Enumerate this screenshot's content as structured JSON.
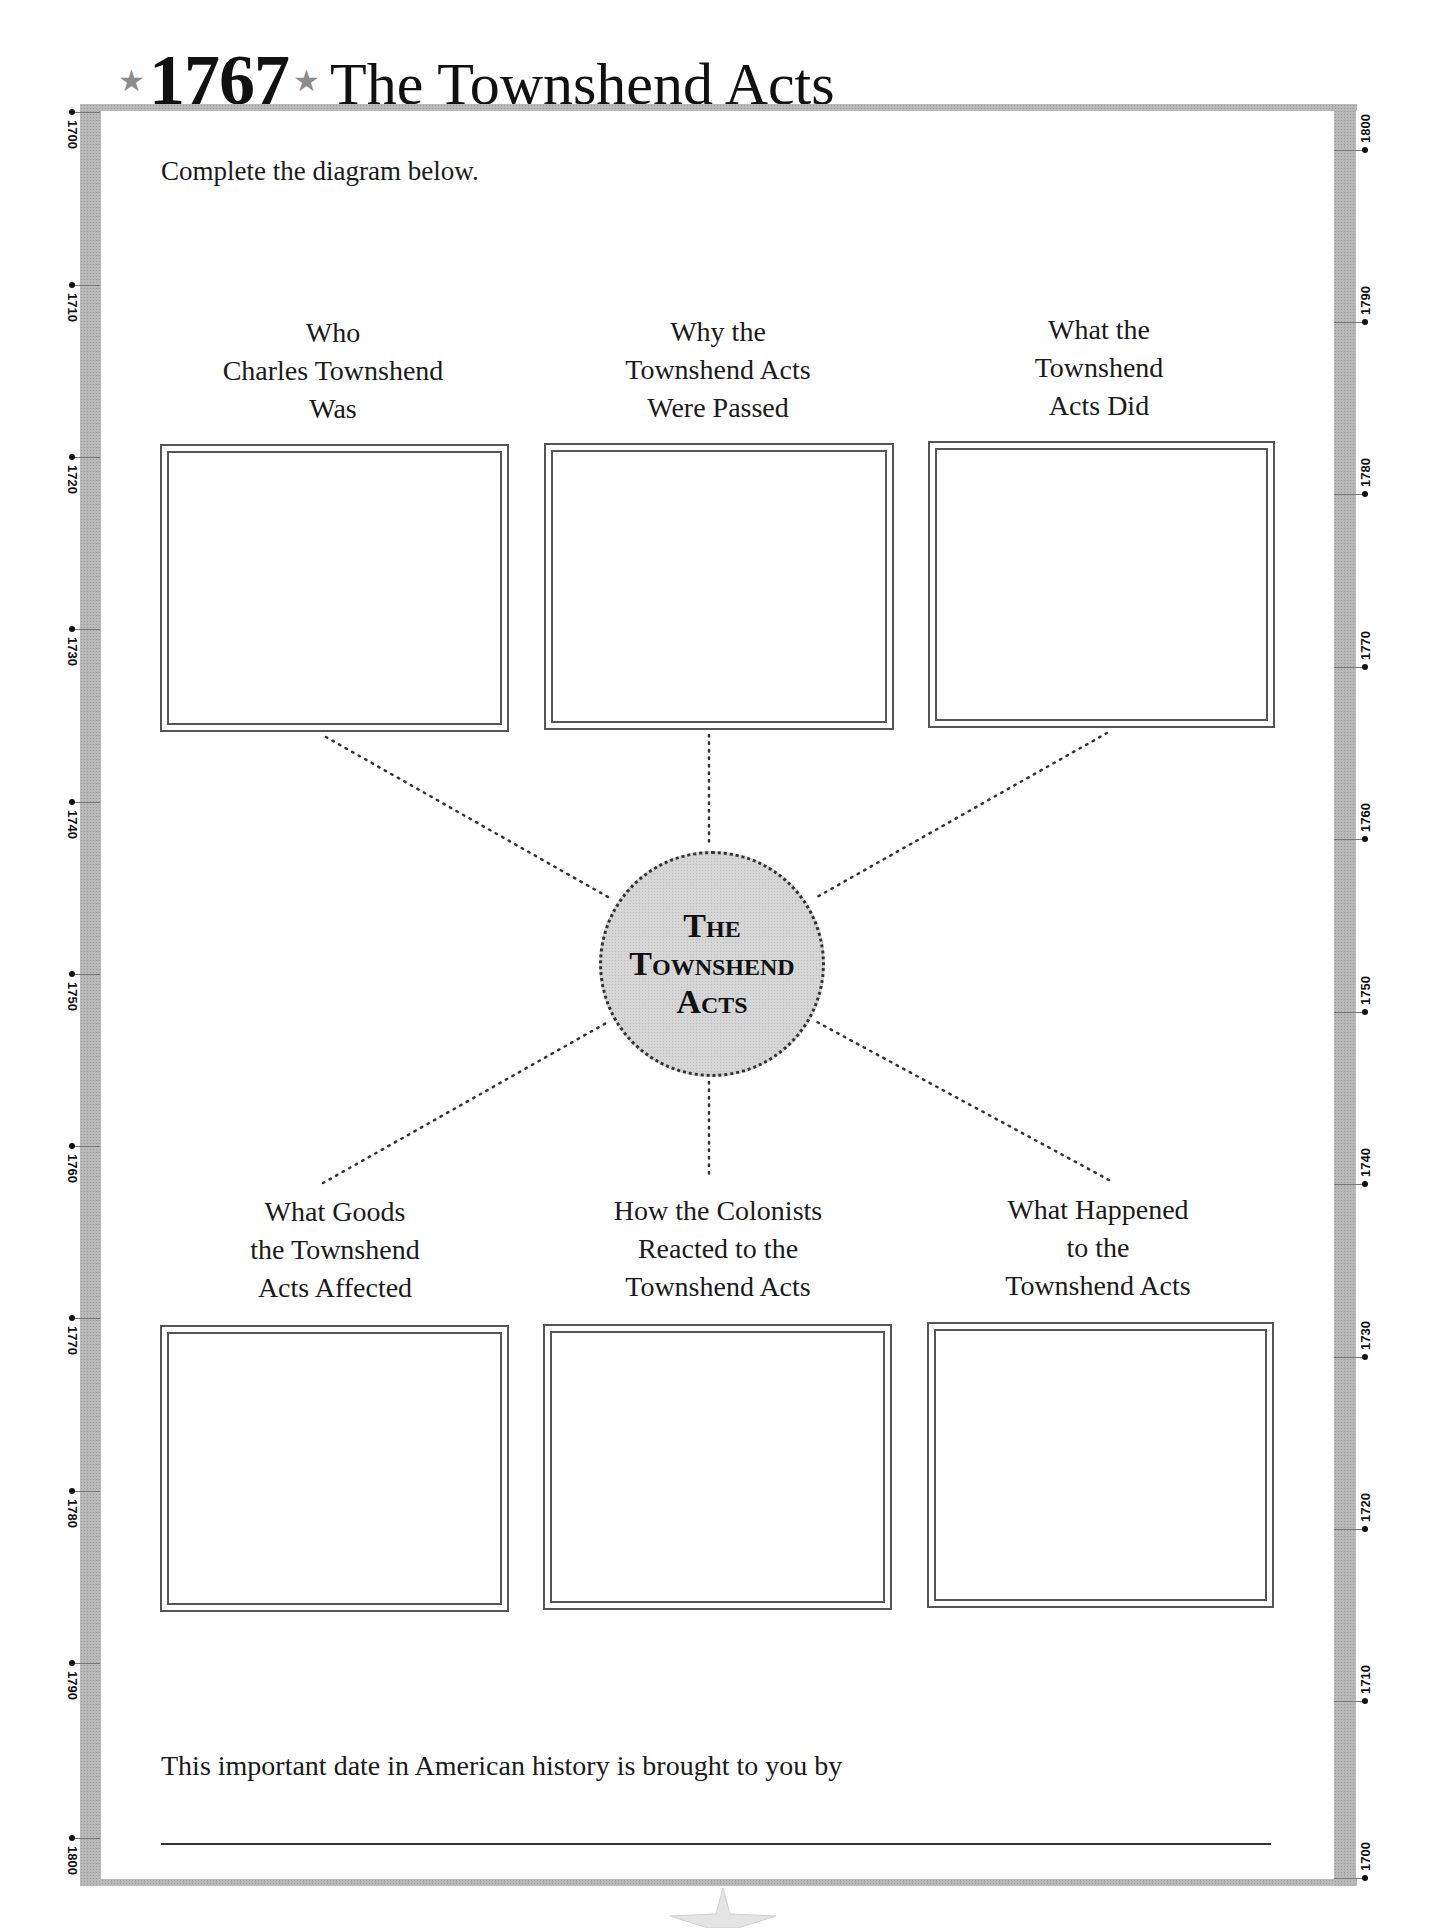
{
  "header": {
    "year": "1767",
    "title": "The Townshend Acts",
    "star_icon": "★"
  },
  "instructions": "Complete the diagram below.",
  "timeline": {
    "left_labels": [
      "1700",
      "1710",
      "1720",
      "1730",
      "1740",
      "1750",
      "1760",
      "1770",
      "1780",
      "1790",
      "1800"
    ],
    "right_labels": [
      "1800",
      "1790",
      "1780",
      "1770",
      "1760",
      "1750",
      "1740",
      "1730",
      "1720",
      "1710",
      "1700"
    ]
  },
  "diagram": {
    "center": {
      "line1": "The",
      "line2": "Townshend",
      "line3": "Acts"
    },
    "boxes": [
      {
        "label": [
          "Who",
          "Charles Townshend",
          "Was"
        ],
        "answer": ""
      },
      {
        "label": [
          "Why the",
          "Townshend Acts",
          "Were Passed"
        ],
        "answer": ""
      },
      {
        "label": [
          "What the",
          "Townshend",
          "Acts Did"
        ],
        "answer": ""
      },
      {
        "label": [
          "What Goods",
          "the Townshend",
          "Acts Affected"
        ],
        "answer": ""
      },
      {
        "label": [
          "How the Colonists",
          "Reacted to the",
          "Townshend Acts"
        ],
        "answer": ""
      },
      {
        "label": [
          "What Happened",
          "to the",
          "Townshend Acts"
        ],
        "answer": ""
      }
    ]
  },
  "footer": {
    "text": "This important date in American history is brought to you by",
    "signature_value": ""
  },
  "colors": {
    "frame_gray": "#b9b9b9",
    "circle_fill": "#d6d6d6",
    "ink": "#1a1a1a"
  }
}
